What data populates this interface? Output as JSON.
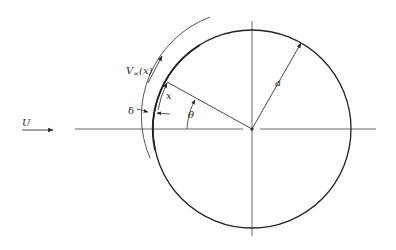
{
  "diagram": {
    "type": "flow-around-cylinder-boundary-layer",
    "colors": {
      "stroke": "#2a2a2a",
      "background": "#ffffff"
    },
    "labels": {
      "freestream": "U",
      "edge_velocity_main": "V",
      "edge_velocity_sub": "∞",
      "edge_velocity_arg": "(x)",
      "arc_length": "x",
      "boundary_layer_thickness": "δ",
      "angle": "θ",
      "radius": "a"
    },
    "geometry": {
      "center": [
        252,
        129
      ],
      "radius": 99
    }
  }
}
